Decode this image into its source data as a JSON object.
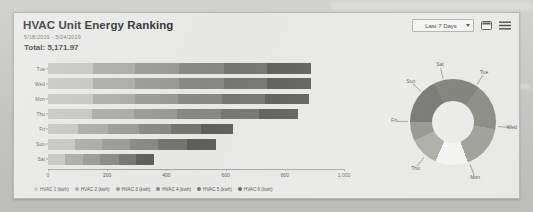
{
  "card": {
    "title": "HVAC Unit Energy Ranking",
    "date_range": "5/18/2019 - 5/24/2019",
    "total_label": "Total: 5,171.97"
  },
  "header_controls": {
    "range_select_value": "Last 7 Days",
    "range_select_options": [
      "Last 7 Days"
    ],
    "caret_icon": "chevron-down-icon",
    "calendar_icon": "calendar-icon",
    "menu_icon": "hamburger-menu-icon"
  },
  "colors": {
    "hvac1": "#c3c3c1",
    "hvac2": "#a8a8a6",
    "hvac3": "#979795",
    "hvac4": "#868684",
    "hvac5": "#74746f",
    "hvac6": "#5d5d58",
    "card_bg": "#e7e7e5",
    "axis": "#a3a3a1",
    "text": "#5d5d5d"
  },
  "chart_data": [
    {
      "type": "bar",
      "title": "HVAC Unit Energy Ranking",
      "orientation": "horizontal",
      "stacked": true,
      "xlabel": "",
      "ylabel": "",
      "xlim": [
        0,
        1000
      ],
      "xticks": [
        0,
        200,
        400,
        600,
        800,
        1000
      ],
      "xticklabels": [
        "0",
        "200",
        "400",
        "600",
        "800",
        "1,000"
      ],
      "grid": false,
      "legend_position": "bottom",
      "categories": [
        "Tue",
        "Wed",
        "Mon",
        "Thu",
        "Fri",
        "Sun",
        "Sat"
      ],
      "series": [
        {
          "name": "HVAC 1 (kwh)",
          "color": "#c3c3c1",
          "values": [
            152,
            152,
            151,
            149,
            103,
            92,
            59
          ]
        },
        {
          "name": "HVAC 2 (kwh)",
          "color": "#a8a8a6",
          "values": [
            143,
            143,
            142,
            141,
            101,
            91,
            58
          ]
        },
        {
          "name": "HVAC 3 (kwh)",
          "color": "#979795",
          "values": [
            148,
            148,
            146,
            145,
            105,
            93,
            60
          ]
        },
        {
          "name": "HVAC 4 (kwh)",
          "color": "#868684",
          "values": [
            151,
            151,
            149,
            148,
            107,
            97,
            62
          ]
        },
        {
          "name": "HVAC 5 (kwh)",
          "color": "#74746f",
          "values": [
            146,
            146,
            145,
            129,
            102,
            96,
            59
          ]
        },
        {
          "name": "HVAC 6 (kwh)",
          "color": "#5d5d58",
          "values": [
            150,
            150,
            148,
            134,
            107,
            98,
            61
          ]
        }
      ],
      "totals": [
        890,
        890,
        881,
        846,
        625,
        567,
        359
      ]
    },
    {
      "type": "pie",
      "variant": "donut",
      "title": "",
      "labels": [
        "Tue",
        "Wed",
        "Mon",
        "Thu",
        "Fri",
        "Sun",
        "Sat"
      ],
      "values": [
        890,
        890,
        881,
        846,
        625,
        567,
        359
      ],
      "colors": [
        "#6a6a66",
        "#76766f",
        "#84847d",
        "#9a9a94",
        "#f3f3f1",
        "#a6a6a0",
        "#8e8e88"
      ],
      "legend_position": "none"
    }
  ]
}
